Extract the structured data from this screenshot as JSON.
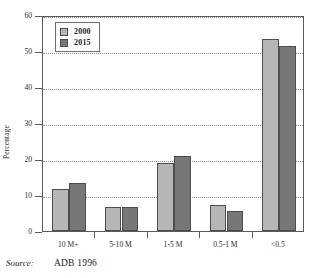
{
  "chart_data": {
    "type": "bar",
    "title": "",
    "xlabel": "",
    "ylabel": "Percentage",
    "ylim": [
      0,
      60
    ],
    "ytick_step": 10,
    "yticks": [
      0,
      10,
      20,
      30,
      40,
      50,
      60
    ],
    "grid": true,
    "legend_position": "top-left",
    "categories": [
      "10 M+",
      "5-10 M",
      "1-5 M",
      "0.5-1 M",
      "<0.5"
    ],
    "series": [
      {
        "name": "2000",
        "color": "#b6b6b6",
        "values": [
          11.7,
          6.8,
          18.8,
          7.3,
          53.3
        ]
      },
      {
        "name": "2015",
        "color": "#77777a",
        "values": [
          13.4,
          6.8,
          20.8,
          5.5,
          51.4
        ]
      }
    ]
  },
  "legend": {
    "items": [
      {
        "label": "2000",
        "color": "#b6b6b6"
      },
      {
        "label": "2015",
        "color": "#77777a"
      }
    ]
  },
  "source": {
    "label": "Source:",
    "value": "ADB 1996"
  },
  "colors": {
    "series_2000": "#b6b6b6",
    "series_2015": "#77777a",
    "axis": "#5a5a5a",
    "grid": "#8d8d8d",
    "bar_outline": "#4d4d4d",
    "background": "#ffffff"
  }
}
